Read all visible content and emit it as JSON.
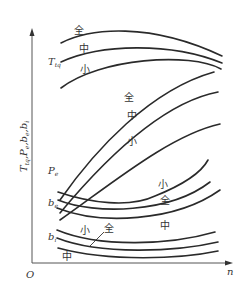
{
  "diagram": {
    "type": "engine-characteristic-curves",
    "axes": {
      "x_label": "n",
      "origin_label": "O",
      "y_label_parts": [
        "T",
        "tq",
        ",P",
        "e",
        ",b",
        "e",
        ",b",
        "i"
      ]
    },
    "groups": [
      {
        "id": "torque",
        "label_main": "T",
        "label_sub": "tq",
        "curves": [
          {
            "name": "全",
            "meaning": "full load"
          },
          {
            "name": "中",
            "meaning": "medium load"
          },
          {
            "name": "小",
            "meaning": "small load"
          }
        ]
      },
      {
        "id": "power",
        "label_main": "P",
        "label_sub": "e",
        "curves": [
          {
            "name": "全"
          },
          {
            "name": "中"
          },
          {
            "name": "小"
          }
        ]
      },
      {
        "id": "effective-fuel-consumption",
        "label_main": "b",
        "label_sub": "e",
        "curves": [
          {
            "name": "小"
          },
          {
            "name": "全"
          },
          {
            "name": "中"
          }
        ]
      },
      {
        "id": "indicated-fuel-consumption",
        "label_main": "b",
        "label_sub": "i",
        "curves": [
          {
            "name": "小"
          },
          {
            "name": "全"
          },
          {
            "name": "中"
          }
        ]
      }
    ],
    "curve_labels": {
      "full": "全",
      "medium": "中",
      "small": "小"
    }
  }
}
